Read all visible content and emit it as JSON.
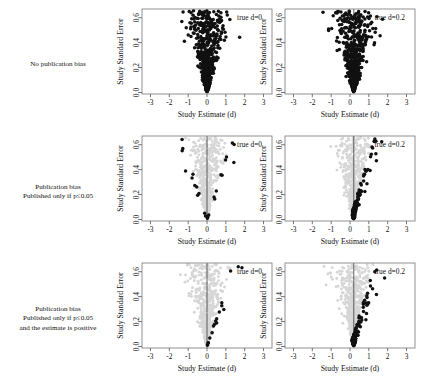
{
  "figure": {
    "title": "",
    "rows": [
      {
        "label_lines": [
          "No publication bias"
        ],
        "condition": "none",
        "panels": [
          {
            "annotation": "true d=0",
            "true_d": 0
          },
          {
            "annotation": "true d=0.2",
            "true_d": 0.2
          }
        ]
      },
      {
        "label_lines": [
          "Publication bias",
          "Published only if p≤0.05"
        ],
        "condition": "significant",
        "panels": [
          {
            "annotation": "true d=0",
            "true_d": 0
          },
          {
            "annotation": "true d=0.2",
            "true_d": 0.2
          }
        ]
      },
      {
        "label_lines": [
          "Publication bias",
          "Published only if p≤0.05",
          "and the estimate is positive"
        ],
        "condition": "significant_positive",
        "panels": [
          {
            "annotation": "true d=0",
            "true_d": 0
          },
          {
            "annotation": "true d=0.2",
            "true_d": 0.2
          }
        ]
      }
    ]
  },
  "axes": {
    "xlabel": "Study Estimate (d)",
    "ylabel": "Study Standard Error",
    "xticks": [
      "-3",
      "-2",
      "-1",
      "0",
      "1",
      "2",
      "3"
    ],
    "xtick_values": [
      -3,
      -2,
      -1,
      0,
      1,
      2,
      3
    ],
    "yticks": [
      "0.0",
      "0.2",
      "0.4",
      "0.6"
    ],
    "ytick_values": [
      0.0,
      0.2,
      0.4,
      0.6
    ],
    "xlim": [
      -3.45,
      3.45
    ],
    "ylim": [
      0.67,
      -0.012
    ]
  },
  "colors": {
    "published_point": "#111111",
    "unpublished_point": "#d6d6d6",
    "axis": "#555555",
    "frame": "#777777",
    "reference_line": "#4d4d4d",
    "background": "#ffffff"
  },
  "chart_data": {
    "type": "scatter",
    "xlabel": "Study Estimate (d)",
    "ylabel": "Study Standard Error",
    "xlim": [
      -3.45,
      3.45
    ],
    "ylim": [
      0.67,
      -0.012
    ],
    "grid": false,
    "legend": null,
    "n_studies_per_panel": 620,
    "significance_criterion": "|d| >= 1.96 * SE",
    "panels": [
      {
        "row": 0,
        "col": 0,
        "true_d": 0,
        "annotation": "true d=0",
        "publication_rule": "all studies published",
        "published_fraction": 1.0
      },
      {
        "row": 0,
        "col": 1,
        "true_d": 0.2,
        "annotation": "true d=0.2",
        "publication_rule": "all studies published",
        "published_fraction": 1.0
      },
      {
        "row": 1,
        "col": 0,
        "true_d": 0,
        "annotation": "true d=0",
        "publication_rule": "published only if p<=0.05",
        "published_fraction": 0.13
      },
      {
        "row": 1,
        "col": 1,
        "true_d": 0.2,
        "annotation": "true d=0.2",
        "publication_rule": "published only if p<=0.05",
        "published_fraction": 0.22
      },
      {
        "row": 2,
        "col": 0,
        "true_d": 0,
        "annotation": "true d=0",
        "publication_rule": "published only if p<=0.05 and estimate positive",
        "published_fraction": 0.065
      },
      {
        "row": 2,
        "col": 1,
        "true_d": 0.2,
        "annotation": "true d=0.2",
        "publication_rule": "published only if p<=0.05 and estimate positive",
        "published_fraction": 0.19
      }
    ]
  }
}
